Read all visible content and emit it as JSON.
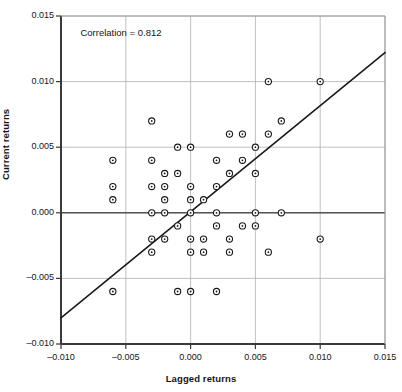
{
  "chart_data": {
    "type": "scatter",
    "title": "",
    "subtitle": "",
    "xlabel": "Lagged returns",
    "ylabel": "Current returns",
    "xlim": [
      -0.01,
      0.015
    ],
    "ylim": [
      -0.01,
      0.015
    ],
    "xticks": [
      "-0.010",
      "-0.005",
      "0.000",
      "0.005",
      "0.010",
      "0.015"
    ],
    "xtick_values": [
      -0.01,
      -0.005,
      0.0,
      0.005,
      0.01,
      0.015
    ],
    "yticks": [
      "0.015",
      "0.010",
      "0.005",
      "0.000",
      "-0.005",
      "-0.010"
    ],
    "ytick_values": [
      0.015,
      0.01,
      0.005,
      0.0,
      -0.005,
      -0.01
    ],
    "grid": true,
    "grid_color": "#b0b0b0",
    "legend": null,
    "legend_position": "none",
    "marker": "open-circle",
    "marker_color": "#1a1a1a",
    "marker_size": 4,
    "annotations": [
      {
        "text": "Correlation = 0.812",
        "x": -0.0085,
        "y": 0.0137
      }
    ],
    "trendline": {
      "type": "line",
      "color": "#1a1a1a",
      "x": [
        -0.01,
        0.015
      ],
      "y": [
        -0.008,
        0.0122
      ]
    },
    "points": [
      {
        "x": -0.006,
        "y": 0.004
      },
      {
        "x": -0.006,
        "y": 0.002
      },
      {
        "x": -0.006,
        "y": 0.001
      },
      {
        "x": -0.006,
        "y": -0.006
      },
      {
        "x": -0.003,
        "y": 0.007
      },
      {
        "x": -0.003,
        "y": 0.004
      },
      {
        "x": -0.003,
        "y": 0.002
      },
      {
        "x": -0.003,
        "y": 0.0
      },
      {
        "x": -0.003,
        "y": -0.002
      },
      {
        "x": -0.003,
        "y": -0.003
      },
      {
        "x": -0.002,
        "y": 0.003
      },
      {
        "x": -0.002,
        "y": 0.002
      },
      {
        "x": -0.002,
        "y": 0.001
      },
      {
        "x": -0.002,
        "y": 0.0
      },
      {
        "x": -0.002,
        "y": -0.002
      },
      {
        "x": -0.001,
        "y": 0.005
      },
      {
        "x": -0.001,
        "y": 0.003
      },
      {
        "x": -0.001,
        "y": -0.001
      },
      {
        "x": -0.001,
        "y": -0.006
      },
      {
        "x": 0.0,
        "y": 0.005
      },
      {
        "x": 0.0,
        "y": 0.002
      },
      {
        "x": 0.0,
        "y": 0.001
      },
      {
        "x": 0.0,
        "y": 0.0
      },
      {
        "x": 0.0,
        "y": -0.002
      },
      {
        "x": 0.0,
        "y": -0.003
      },
      {
        "x": 0.0,
        "y": -0.006
      },
      {
        "x": 0.001,
        "y": 0.001
      },
      {
        "x": 0.001,
        "y": -0.002
      },
      {
        "x": 0.001,
        "y": -0.003
      },
      {
        "x": 0.002,
        "y": 0.004
      },
      {
        "x": 0.002,
        "y": 0.002
      },
      {
        "x": 0.002,
        "y": 0.0
      },
      {
        "x": 0.002,
        "y": -0.001
      },
      {
        "x": 0.002,
        "y": -0.006
      },
      {
        "x": 0.003,
        "y": 0.006
      },
      {
        "x": 0.003,
        "y": 0.003
      },
      {
        "x": 0.003,
        "y": -0.002
      },
      {
        "x": 0.003,
        "y": -0.003
      },
      {
        "x": 0.004,
        "y": 0.006
      },
      {
        "x": 0.004,
        "y": 0.004
      },
      {
        "x": 0.004,
        "y": -0.001
      },
      {
        "x": 0.005,
        "y": 0.005
      },
      {
        "x": 0.005,
        "y": 0.003
      },
      {
        "x": 0.005,
        "y": 0.0
      },
      {
        "x": 0.005,
        "y": -0.001
      },
      {
        "x": 0.006,
        "y": 0.01
      },
      {
        "x": 0.006,
        "y": 0.006
      },
      {
        "x": 0.006,
        "y": -0.003
      },
      {
        "x": 0.007,
        "y": 0.007
      },
      {
        "x": 0.007,
        "y": 0.0
      },
      {
        "x": 0.01,
        "y": 0.01
      },
      {
        "x": 0.01,
        "y": -0.002
      }
    ]
  },
  "plot": {
    "annotation_text": "Correlation = 0.812",
    "x_axis_title": "Lagged returns",
    "y_axis_title": "Current returns"
  }
}
